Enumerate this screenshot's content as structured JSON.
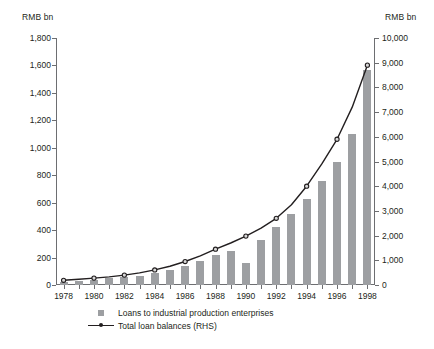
{
  "chart_data": {
    "type": "bar",
    "title": "",
    "subtitle": "",
    "xlabel": "",
    "ylabel": "RMB bn",
    "y2label": "RMB bn",
    "grid": false,
    "legend_position": "bottom",
    "x": [
      1978,
      1979,
      1980,
      1981,
      1982,
      1983,
      1984,
      1985,
      1986,
      1987,
      1988,
      1989,
      1990,
      1991,
      1992,
      1993,
      1994,
      1995,
      1996,
      1997,
      1998
    ],
    "xtick_labels": [
      "1978",
      "1980",
      "1982",
      "1984",
      "1986",
      "1988",
      "1990",
      "1992",
      "1994",
      "1996",
      "1998"
    ],
    "xtick_values": [
      1978,
      1980,
      1982,
      1984,
      1986,
      1988,
      1990,
      1992,
      1994,
      1996,
      1998
    ],
    "ylim": [
      0,
      1800
    ],
    "ytick_labels": [
      "0",
      "200",
      "400",
      "600",
      "800",
      "1,000",
      "1,200",
      "1,400",
      "1,600",
      "1,800"
    ],
    "ytick_values": [
      0,
      200,
      400,
      600,
      800,
      1000,
      1200,
      1400,
      1600,
      1800
    ],
    "y2lim": [
      0,
      10000
    ],
    "y2tick_labels": [
      "0",
      "1,000",
      "2,000",
      "3,000",
      "4,000",
      "5,000",
      "6,000",
      "7,000",
      "8,000",
      "9,000",
      "10,000"
    ],
    "y2tick_values": [
      0,
      1000,
      2000,
      3000,
      4000,
      5000,
      6000,
      7000,
      8000,
      9000,
      10000
    ],
    "series": [
      {
        "name": "Loans to industrial production enterprises",
        "type": "bar",
        "axis": "left",
        "color": "#9d9fa2",
        "values": [
          25,
          32,
          40,
          48,
          55,
          68,
          85,
          110,
          140,
          175,
          215,
          250,
          160,
          330,
          420,
          520,
          630,
          760,
          900,
          1100,
          1570
        ]
      },
      {
        "name": "Total loan balances (RHS)",
        "type": "line",
        "axis": "right",
        "color": "#231f20",
        "marker": "circle",
        "values": [
          190,
          230,
          280,
          330,
          400,
          490,
          610,
          760,
          950,
          1180,
          1450,
          1700,
          1980,
          2300,
          2700,
          3250,
          4000,
          4900,
          5900,
          7200,
          8900
        ]
      }
    ]
  }
}
